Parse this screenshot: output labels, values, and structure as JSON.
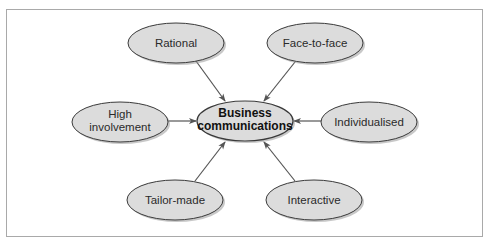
{
  "diagram": {
    "colors": {
      "node_fill": "#dcdcdc",
      "node_stroke": "#3a3a3a",
      "node_shadow": "#9a9a9a",
      "arrow": "#555555",
      "frame_border": "#a9a9a9"
    },
    "center": {
      "id": "business-communications",
      "lines": [
        "Business",
        "communications"
      ]
    },
    "nodes": [
      {
        "id": "rational",
        "lines": [
          "Rational"
        ]
      },
      {
        "id": "face-to-face",
        "lines": [
          "Face-to-face"
        ]
      },
      {
        "id": "high-involvement",
        "lines": [
          "High",
          "involvement"
        ]
      },
      {
        "id": "individualised",
        "lines": [
          "Individualised"
        ]
      },
      {
        "id": "tailor-made",
        "lines": [
          "Tailor-made"
        ]
      },
      {
        "id": "interactive",
        "lines": [
          "Interactive"
        ]
      }
    ],
    "edges": [
      {
        "from": "rational",
        "to": "business-communications"
      },
      {
        "from": "face-to-face",
        "to": "business-communications"
      },
      {
        "from": "high-involvement",
        "to": "business-communications"
      },
      {
        "from": "individualised",
        "to": "business-communications"
      },
      {
        "from": "tailor-made",
        "to": "business-communications"
      },
      {
        "from": "interactive",
        "to": "business-communications"
      }
    ]
  }
}
